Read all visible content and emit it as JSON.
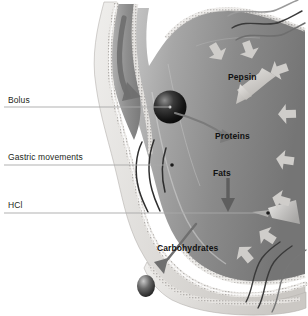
{
  "figure": {
    "background_color": "#ffffff"
  },
  "leader_labels": [
    {
      "id": "bolus",
      "text": "Bolus",
      "x": 8,
      "y": 95,
      "line_y": 107,
      "line_x2": 170
    },
    {
      "id": "gastric-movements",
      "text": "Gastric movements",
      "x": 8,
      "y": 152,
      "line_y": 165,
      "line_x2": 172
    },
    {
      "id": "hcl",
      "text": "HCl",
      "x": 8,
      "y": 200,
      "line_y": 213,
      "line_x2": 268
    }
  ],
  "inner_labels": [
    {
      "id": "pepsin",
      "text": "Pepsin",
      "x": 228,
      "y": 72
    },
    {
      "id": "proteins",
      "text": "Proteins",
      "x": 215,
      "y": 131
    },
    {
      "id": "fats",
      "text": "Fats",
      "x": 213,
      "y": 168
    },
    {
      "id": "carbohydrates",
      "text": "Carbohydrates",
      "x": 157,
      "y": 243
    }
  ],
  "colors": {
    "wall_light": "#e2e0dd",
    "wall_edge": "#b9b6b2",
    "lumen_dark": "#6e6e6e",
    "lumen_mid": "#9b9b9b",
    "lumen_light": "#c6c6c6",
    "arrow_gray": "#6f6f6f",
    "secretion_arrow": "#cfcdca",
    "leader_line": "#9a9a9a",
    "text_dark": "#231f20",
    "bolus_dark": "#101010"
  },
  "icons": {
    "bolus_sphere": "sphere-icon",
    "chyme_sphere": "sphere-icon",
    "swallow_arrow": "curved-arrow-icon",
    "protein_arrow": "curved-arrow-icon",
    "fats_arrow": "down-arrow-icon",
    "carbs_arrow": "curved-arrow-icon",
    "pepsin_arrow": "block-arrow-icon",
    "motion_lines": "wavy-motion-lines-icon",
    "secretion_arrows": "block-arrow-icon"
  }
}
